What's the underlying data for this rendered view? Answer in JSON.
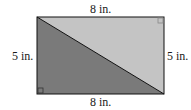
{
  "diagram": {
    "shape": "rectangle split by diagonal into two right triangles",
    "labels": {
      "top": "8 in.",
      "bottom": "8 in.",
      "left": "5 in.",
      "right": "5 in."
    },
    "colors": {
      "upper_triangle": "#c4c4c4",
      "lower_triangle": "#7a7a7a",
      "outline": "#111111"
    },
    "right_angle_marks": [
      "top-right",
      "bottom-left"
    ]
  }
}
